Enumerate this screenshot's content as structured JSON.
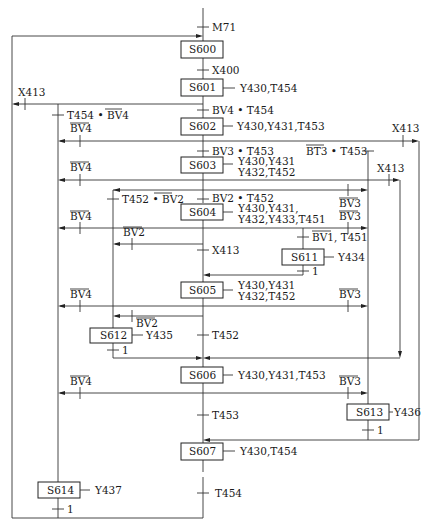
{
  "diagram": {
    "type": "sequential-function-chart",
    "steps": [
      {
        "id": "S600",
        "label": "S600",
        "actions": []
      },
      {
        "id": "S601",
        "label": "S601",
        "actions": [
          "Y430,T454"
        ]
      },
      {
        "id": "S602",
        "label": "S602",
        "actions": [
          "Y430,Y431,T453"
        ]
      },
      {
        "id": "S603",
        "label": "S603",
        "actions": [
          "Y430,Y431",
          "Y432,T452"
        ]
      },
      {
        "id": "S604",
        "label": "S604",
        "actions": [
          "Y430,Y431,",
          "Y432,Y433,T451"
        ]
      },
      {
        "id": "S611",
        "label": "S611",
        "actions": [
          "Y434"
        ]
      },
      {
        "id": "S605",
        "label": "S605",
        "actions": [
          "Y430,Y431",
          "Y432,T452"
        ]
      },
      {
        "id": "S612",
        "label": "S612",
        "actions": [
          "Y435"
        ]
      },
      {
        "id": "S606",
        "label": "S606",
        "actions": [
          "Y430,Y431,T453"
        ]
      },
      {
        "id": "S613",
        "label": "S613",
        "actions": [
          "Y436"
        ]
      },
      {
        "id": "S607",
        "label": "S607",
        "actions": [
          "Y430,T454"
        ]
      },
      {
        "id": "S614",
        "label": "S614",
        "actions": [
          "Y437"
        ]
      }
    ],
    "transitions": {
      "t_m71": "M71",
      "t_x400": "X400",
      "t_601_x413": "X413",
      "t_601_602": "BV4 • T454",
      "t_614_left": {
        "a": "T454 • ",
        "b": "BV4",
        "b_overline": true
      },
      "t_602_bv4": "BV4",
      "t_602_x413": "X413",
      "t_602_603": "BV3 • T453",
      "t_602_bt3": {
        "a": "BT3",
        "a_overline": true,
        "b": " • T453"
      },
      "t_603_bv4": "BV4",
      "t_603_x413": "X413",
      "t_604_back": {
        "a": "T452 • ",
        "b": "BV2",
        "b_overline": true
      },
      "t_603_604": "BV2 • T452",
      "t_603_bv3": "BV3",
      "t_604_bv3": "BV3",
      "t_604_bv4": "BV4",
      "t_604_bv2": "BV2",
      "t_604_x413": "X413",
      "t_611": {
        "a": "BV1",
        "a_overline": true,
        "b": ", T451"
      },
      "t_611_1": "1",
      "t_605_bv4": "BV4",
      "t_605_bv3": "BV3",
      "t_605_bv2": "BV2",
      "t_612_1": "1",
      "t_605_606": "T452",
      "t_606_bv4": "BV4",
      "t_606_bv3": "BV3",
      "t_606_607": "T453",
      "t_613_1": "1",
      "t_607_next": "T454",
      "t_614_1": "1"
    }
  }
}
